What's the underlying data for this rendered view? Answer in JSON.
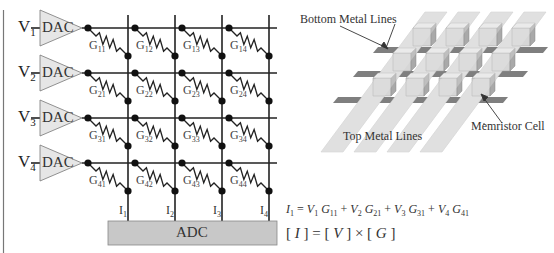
{
  "figure": {
    "left_panel": {
      "title": "Memristor crossbar circuit",
      "rows": [
        {
          "voltage": "V",
          "voltage_sub": "1",
          "dac_label": "DAC"
        },
        {
          "voltage": "V",
          "voltage_sub": "2",
          "dac_label": "DAC"
        },
        {
          "voltage": "V",
          "voltage_sub": "3",
          "dac_label": "DAC"
        },
        {
          "voltage": "V",
          "voltage_sub": "4",
          "dac_label": "DAC"
        }
      ],
      "conductances": [
        [
          "11",
          "12",
          "13",
          "14"
        ],
        [
          "21",
          "22",
          "23",
          "24"
        ],
        [
          "31",
          "32",
          "33",
          "34"
        ],
        [
          "41",
          "42",
          "43",
          "44"
        ]
      ],
      "conductance_symbol": "G",
      "currents": [
        {
          "symbol": "I",
          "sub": "1"
        },
        {
          "symbol": "I",
          "sub": "2"
        },
        {
          "symbol": "I",
          "sub": "3"
        },
        {
          "symbol": "I",
          "sub": "4"
        }
      ],
      "adc_label": "ADC"
    },
    "equations": {
      "eq1": {
        "lhs": "I",
        "lhs_sub": "1",
        "terms": [
          {
            "v": "V",
            "v_sub": "1",
            "g": "G",
            "g_sub": "11"
          },
          {
            "v": "V",
            "v_sub": "2",
            "g": "G",
            "g_sub": "21"
          },
          {
            "v": "V",
            "v_sub": "3",
            "g": "G",
            "g_sub": "31"
          },
          {
            "v": "V",
            "v_sub": "4",
            "g": "G",
            "g_sub": "41"
          }
        ],
        "equals": "=",
        "plus": "+"
      },
      "eq2": {
        "text_I": "I",
        "text_V": "V",
        "text_G": "G",
        "lbr": "[",
        "rbr": "]",
        "equals": "=",
        "times": "×"
      }
    },
    "right_panel": {
      "label_bottom_lines": "Bottom Metal Lines",
      "label_top_lines": "Top Metal Lines",
      "label_cell": "Memristor Cell",
      "colors": {
        "bottom_line": "#7f7f7f",
        "top_line": "#dcdcdc",
        "cell_front": "#d6d6d6",
        "cell_side": "#a9a9a9",
        "cell_top": "#ececec",
        "dac_fill": "#e6e6e6",
        "adc_fill": "#c8c8c8"
      }
    }
  }
}
